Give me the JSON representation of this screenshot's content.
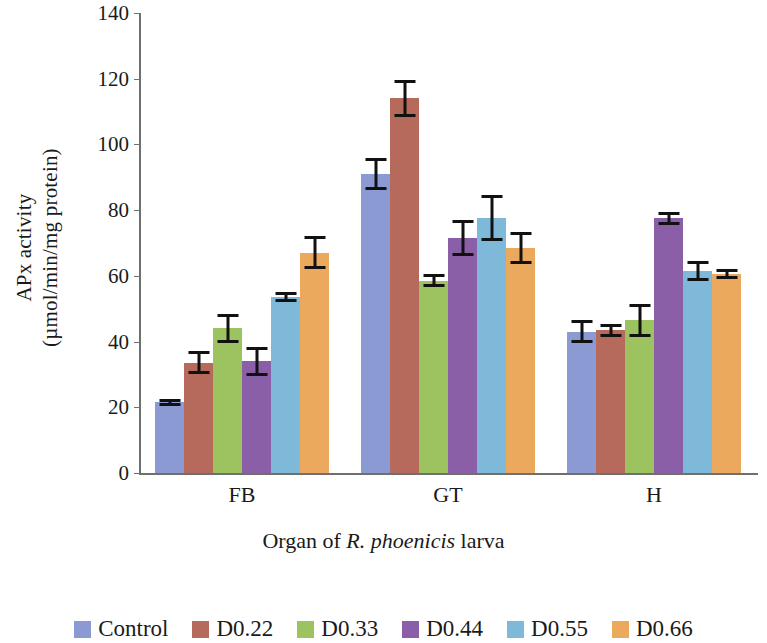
{
  "chart_data": {
    "type": "bar",
    "title": "",
    "xlabel": "Organ of R. phoenicis larva",
    "xlabel_parts": {
      "pre": "Organ of ",
      "italic": "R. phoenicis",
      "post": " larva"
    },
    "ylabel_line1": "APx activity",
    "ylabel_line2": "(µmol/min/mg protein)",
    "ylim": [
      0,
      140
    ],
    "yticks": [
      0,
      20,
      40,
      60,
      80,
      100,
      120,
      140
    ],
    "ytick_labels": [
      "0",
      "20",
      "40",
      "60",
      "80",
      "100",
      "120",
      "140"
    ],
    "grid": false,
    "legend_position": "bottom",
    "categories": [
      "FB",
      "GT",
      "H"
    ],
    "series": [
      {
        "name": "Control",
        "color": "#8c9ad4",
        "values": [
          21.5,
          91.0,
          43.0
        ],
        "errors": [
          1.0,
          5.0,
          3.5
        ]
      },
      {
        "name": "D0.22",
        "color": "#b56a5c",
        "values": [
          33.5,
          114.0,
          43.5
        ],
        "errors": [
          3.5,
          5.5,
          2.0
        ]
      },
      {
        "name": "D0.33",
        "color": "#9dc260",
        "values": [
          44.0,
          58.5,
          46.5
        ],
        "errors": [
          4.5,
          2.0,
          5.0
        ]
      },
      {
        "name": "D0.44",
        "color": "#8a5fa8",
        "values": [
          34.0,
          71.5,
          77.5
        ],
        "errors": [
          4.5,
          5.5,
          2.0
        ]
      },
      {
        "name": "D0.55",
        "color": "#7fb9d9",
        "values": [
          53.5,
          77.5,
          61.5
        ],
        "errors": [
          1.5,
          7.0,
          3.0
        ]
      },
      {
        "name": "D0.66",
        "color": "#eaa95c",
        "values": [
          67.0,
          68.5,
          60.5
        ],
        "errors": [
          5.0,
          5.0,
          1.5
        ]
      }
    ]
  }
}
